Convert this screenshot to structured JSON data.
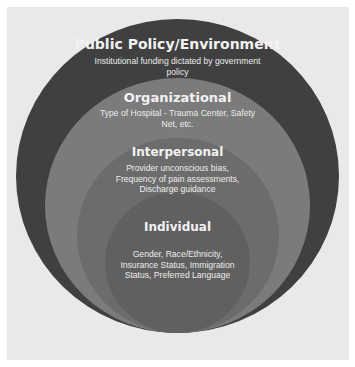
{
  "diagram": {
    "type": "nested-circles",
    "colors": {
      "background": "#e9e9e9",
      "public_policy": "#404040",
      "organizational": "#7b7b7b",
      "interpersonal": "#6c6c6c",
      "individual": "#606060",
      "text": "#f2f2f2"
    },
    "levels": [
      {
        "title": "Public Policy/Environment",
        "description_lines": [
          "Institutional funding dictated by government",
          "policy"
        ]
      },
      {
        "title": "Organizational",
        "description_lines": [
          "Type of Hospital - Trauma Center, Safety",
          "Net, etc."
        ]
      },
      {
        "title": "Interpersonal",
        "description_lines": [
          "Provider unconscious bias,",
          "Frequency of pain assessments,",
          "Discharge guidance"
        ]
      },
      {
        "title": "Individual",
        "description_lines": [
          "Gender, Race/Ethnicity,",
          "Insurance Status, Immigration",
          "Status, Preferred Language"
        ]
      }
    ]
  }
}
